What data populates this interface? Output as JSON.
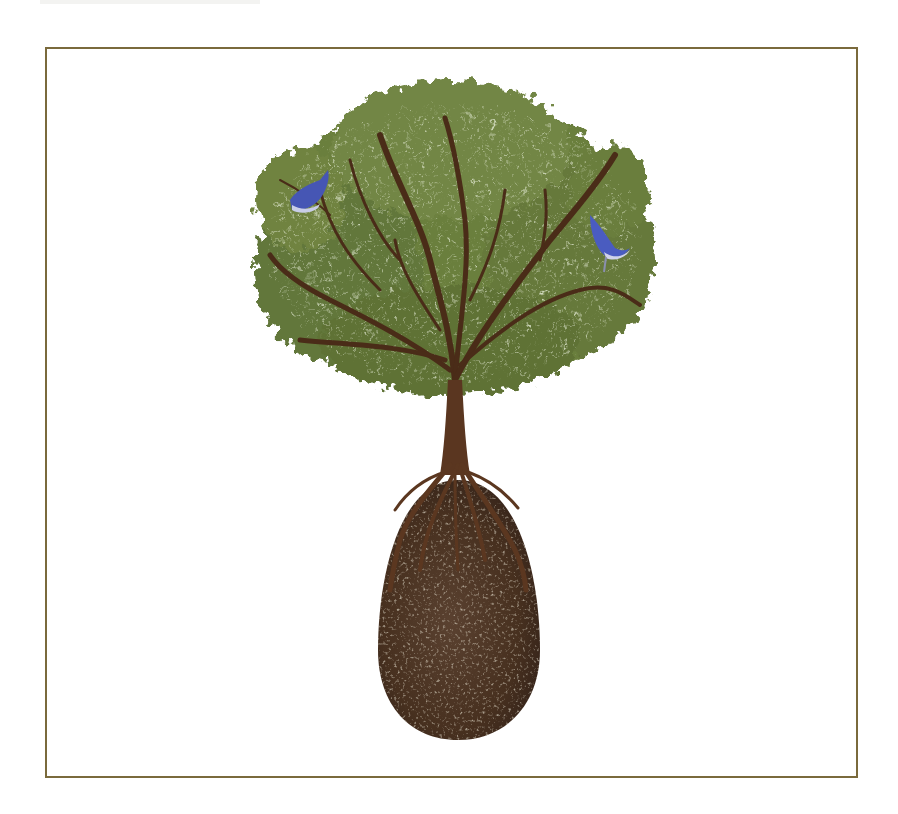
{
  "image": {
    "subject": "Tree growing from an egg-shaped earthen pod with roots wrapped around it",
    "caption": "Illustration of a tree with roots encircling an egg-shaped soil pod, two blue birds perched in the canopy",
    "frame_color": "#7a6a3c",
    "background": "#ffffff"
  },
  "elements": {
    "canopy": {
      "color_primary": "#6b7f3e",
      "color_dark": "#4e5f2c",
      "color_light": "#a7b578"
    },
    "branches": {
      "color": "#4a2c18"
    },
    "trunk": {
      "color": "#5a3620"
    },
    "pod": {
      "color": "#4a3426",
      "speckle": "#b9ab8c"
    },
    "birds": [
      {
        "name": "bird-left",
        "color": "#4656b4",
        "belly": "#c9cde8"
      },
      {
        "name": "bird-right",
        "color": "#4a5cc0",
        "belly": "#d0d3ea"
      }
    ]
  }
}
